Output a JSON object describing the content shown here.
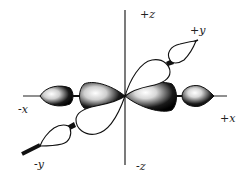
{
  "diagram": {
    "axes": {
      "pos_z": "+z",
      "neg_z": "-z",
      "pos_y": "+y",
      "neg_y": "-y",
      "pos_x": "+x",
      "neg_x": "-x"
    },
    "colors": {
      "ink": "#111111",
      "shaded_lobe": "#1a1a1a",
      "highlight": "#ffffff",
      "open_lobe": "#ffffff",
      "background": "#ffffff"
    }
  }
}
